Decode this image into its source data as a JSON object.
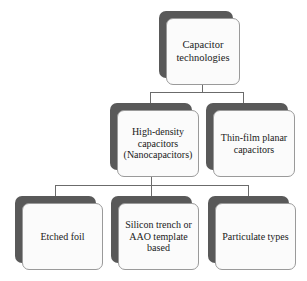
{
  "diagram": {
    "type": "tree",
    "colors": {
      "box_fill": "#fbfbfb",
      "box_border": "#9a9a9a",
      "shadow": "#595959",
      "connector": "#6b6b6b",
      "text": "#1a1a1a",
      "background": "#ffffff"
    },
    "nodes": {
      "root": {
        "label": "Capacitor\ntechnologies"
      },
      "level1": [
        {
          "label": "High-density\ncapacitors\n(Nanocapacitors)"
        },
        {
          "label": "Thin-film planar\ncapacitors"
        }
      ],
      "level2": [
        {
          "label": "Etched foil"
        },
        {
          "label": "Silicon trench or\nAAO template\nbased"
        },
        {
          "label": "Particulate types"
        }
      ]
    }
  }
}
